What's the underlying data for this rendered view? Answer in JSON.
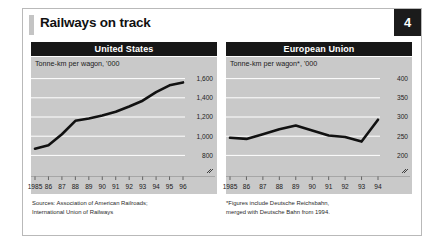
{
  "header": {
    "title": "Railways on track",
    "badge": "4"
  },
  "footnotes": {
    "left": "Sources: Association of American Railroads;\nInternational Union of Railways",
    "right": "*Figures include Deutsche Reichsbahn,\nmerged with Deutsche Bahn from 1994."
  },
  "colors": {
    "plot_background": "#c9c9c9",
    "gridline": "#ffffff",
    "line": "#111111",
    "header_bar": "#171717",
    "badge": "#1b1b1b"
  },
  "chart_data": [
    {
      "type": "line",
      "title": "United States",
      "subtitle": "Tonne-km per wagon, '000",
      "xlabel": "",
      "ylabel": "",
      "grid": true,
      "legend": "none",
      "axis_break": true,
      "ylim": [
        700,
        1700
      ],
      "yticks": [
        800,
        1000,
        1200,
        1400,
        1600
      ],
      "ytick_labels": [
        "800",
        "1,000",
        "1,200",
        "1,400",
        "1,600"
      ],
      "categories": [
        "1985",
        "86",
        "87",
        "88",
        "89",
        "90",
        "91",
        "92",
        "93",
        "94",
        "95",
        "96"
      ],
      "values": [
        870,
        905,
        1020,
        1160,
        1185,
        1215,
        1255,
        1310,
        1370,
        1460,
        1530,
        1560
      ]
    },
    {
      "type": "line",
      "title": "European Union",
      "subtitle": "Tonne-km per wagon*, '000",
      "xlabel": "",
      "ylabel": "",
      "grid": true,
      "legend": "none",
      "axis_break": true,
      "ylim": [
        175,
        425
      ],
      "yticks": [
        200,
        250,
        300,
        350,
        400
      ],
      "ytick_labels": [
        "200",
        "250",
        "300",
        "350",
        "400"
      ],
      "categories": [
        "1985",
        "86",
        "87",
        "88",
        "89",
        "90",
        "91",
        "92",
        "93",
        "94"
      ],
      "values": [
        246,
        243,
        255,
        268,
        278,
        265,
        252,
        248,
        236,
        293
      ]
    }
  ]
}
